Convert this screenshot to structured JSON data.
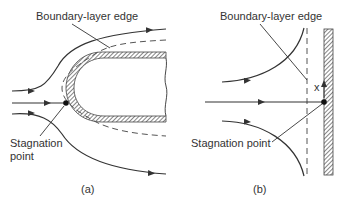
{
  "figure": {
    "panel_a": {
      "caption": "(a)",
      "labels": {
        "boundary_layer_edge": "Boundary-layer edge",
        "stagnation_point_line1": "Stagnation",
        "stagnation_point_line2": "point"
      },
      "description": "Flow around a blunt (rounded) body with boundary layer; streamlines divide at stagnation point"
    },
    "panel_b": {
      "caption": "(b)",
      "labels": {
        "boundary_layer_edge": "Boundary-layer edge",
        "stagnation_point": "Stagnation point",
        "x_axis": "x"
      },
      "description": "Two-dimensional stagnation-point flow against a flat wall"
    },
    "colors": {
      "line": "#333333",
      "hatch": "#555555",
      "background": "#ffffff"
    }
  }
}
